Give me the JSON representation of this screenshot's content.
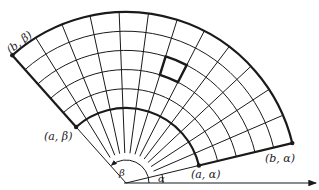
{
  "diagram": {
    "type": "polar-rectangle-grid",
    "origin": {
      "x": 126,
      "y": 183
    },
    "r_inner": 75,
    "r_outer": 171,
    "alpha_deg": 13.5,
    "beta_deg": 131.7,
    "angular_divisions": 12,
    "radial_divisions": 5,
    "highlighted_cell": {
      "radial_index": 2,
      "angular_index": 5
    },
    "colors": {
      "line": "#1a1a1a",
      "background": "#ffffff"
    },
    "labels": {
      "b_beta": "(b, β)",
      "a_beta": "(a, β)",
      "a_alpha": "(a, α)",
      "b_alpha": "(b, α)",
      "beta": "β",
      "alpha": "α"
    }
  }
}
